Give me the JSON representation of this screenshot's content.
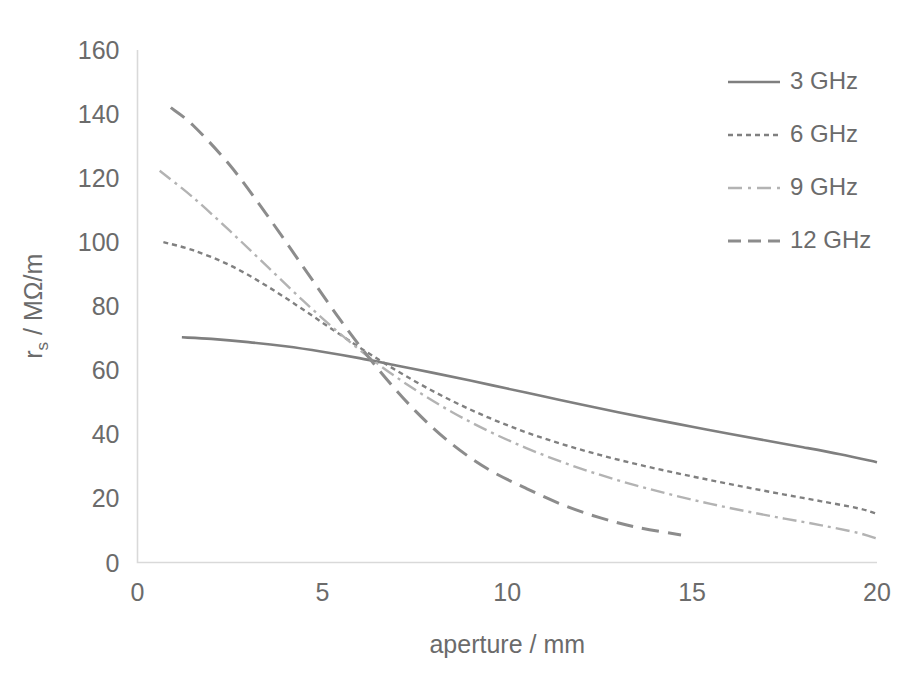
{
  "chart_data": {
    "type": "line",
    "title": "",
    "xlabel": "aperture / mm",
    "ylabel": "r_s / MΩ/m",
    "ylabel_main": "r",
    "ylabel_sub": "s",
    "ylabel_rest": " / MΩ/m",
    "xlim": [
      0,
      20
    ],
    "ylim": [
      0,
      160
    ],
    "xticks": [
      0,
      5,
      10,
      15,
      20
    ],
    "yticks": [
      0,
      20,
      40,
      60,
      80,
      100,
      120,
      140,
      160
    ],
    "xtick_labels": [
      "0",
      "5",
      "10",
      "15",
      "20"
    ],
    "ytick_labels": [
      "0",
      "20",
      "40",
      "60",
      "80",
      "100",
      "120",
      "140",
      "160"
    ],
    "grid": false,
    "legend_position": "top-right",
    "axis_color": "#d9d9d9",
    "text_color": "#6b6b6b",
    "series": [
      {
        "name": "3 GHz",
        "style": "solid",
        "color": "#7f7f7f",
        "stroke_width": 2.6,
        "dasharray": "",
        "legend_dash": "",
        "x": [
          1.2,
          2,
          3,
          4,
          5,
          6,
          7,
          8,
          9,
          10,
          11,
          12,
          13,
          14,
          15,
          16,
          17,
          18,
          19,
          20
        ],
        "y": [
          70.3,
          69.8,
          68.8,
          67.5,
          65.8,
          63.8,
          61.5,
          59.2,
          56.8,
          54.3,
          51.8,
          49.3,
          46.9,
          44.6,
          42.4,
          40.2,
          38.1,
          36.0,
          33.8,
          31.3
        ]
      },
      {
        "name": "6 GHz",
        "style": "dotted",
        "color": "#808080",
        "stroke_width": 2.4,
        "dasharray": "5,4",
        "legend_dash": "5,4",
        "x": [
          0.7,
          1.5,
          2.5,
          3.5,
          4.5,
          5.5,
          6.5,
          7.5,
          8.5,
          9.5,
          10.5,
          11.5,
          12.5,
          13.5,
          14.5,
          15.5,
          16.5,
          17.5,
          18.5,
          19.5,
          20
        ],
        "y": [
          100.0,
          97.5,
          92.8,
          86.3,
          78.8,
          71.0,
          63.5,
          56.6,
          50.5,
          45.2,
          40.7,
          36.9,
          33.6,
          30.7,
          28.1,
          25.7,
          23.4,
          21.2,
          19.1,
          16.9,
          15.2
        ]
      },
      {
        "name": "9 GHz",
        "style": "dashdot",
        "color": "#b3b3b3",
        "stroke_width": 2.4,
        "dasharray": "14,5,3,5",
        "legend_dash": "14,6,3,6",
        "x": [
          0.6,
          1.5,
          2.5,
          3.5,
          4.5,
          5.5,
          6.5,
          7.5,
          8.5,
          9.5,
          10.5,
          11.5,
          12.5,
          13.5,
          14.5,
          15.5,
          16.5,
          17.5,
          18.5,
          19.5,
          20
        ],
        "y": [
          122.3,
          114.0,
          103.5,
          92.5,
          81.5,
          71.2,
          62.0,
          54.0,
          47.0,
          41.0,
          35.8,
          31.3,
          27.4,
          24.0,
          21.0,
          18.3,
          15.9,
          13.7,
          11.6,
          9.2,
          7.4
        ]
      },
      {
        "name": "12 GHz",
        "style": "dashed",
        "color": "#8c8c8c",
        "stroke_width": 3.0,
        "dasharray": "17,9",
        "legend_dash": "13,7",
        "x": [
          0.9,
          1.5,
          2.5,
          3.5,
          4.5,
          5.5,
          6.5,
          7.5,
          8.5,
          9.5,
          10.5,
          11.5,
          12.5,
          13.5,
          14.7
        ],
        "y": [
          142.0,
          136.5,
          124.0,
          108.5,
          92.0,
          75.5,
          60.5,
          47.5,
          37.0,
          29.0,
          23.2,
          18.0,
          14.0,
          11.0,
          8.6
        ]
      }
    ],
    "legend": [
      {
        "label": "3 GHz"
      },
      {
        "label": "6 GHz"
      },
      {
        "label": "9 GHz"
      },
      {
        "label": "12 GHz"
      }
    ]
  }
}
